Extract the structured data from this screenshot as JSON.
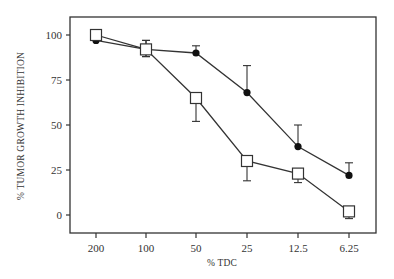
{
  "chart_data": {
    "type": "line",
    "title": "",
    "xlabel": "% TDC",
    "ylabel": "% TUMOR GROWTH INHIBITION",
    "categories": [
      "200",
      "100",
      "50",
      "25",
      "12.5",
      "6.25"
    ],
    "yticks": [
      "0",
      "25",
      "50",
      "75",
      "100"
    ],
    "ylim": [
      -8,
      115
    ],
    "grid": false,
    "legend": "none",
    "series": [
      {
        "name": "filled-circle series",
        "marker": "filled-circle",
        "values": [
          97,
          92,
          90,
          68,
          38,
          22
        ],
        "error_upper": [
          null,
          97,
          94,
          83,
          50,
          29
        ],
        "error_lower": [
          null,
          88,
          null,
          null,
          null,
          null
        ]
      },
      {
        "name": "open-square series",
        "marker": "open-square",
        "values": [
          100,
          92,
          65,
          30,
          23,
          2
        ],
        "error_upper": [
          null,
          97,
          null,
          null,
          null,
          null
        ],
        "error_lower": [
          null,
          88,
          52,
          19,
          18,
          -2
        ]
      }
    ]
  }
}
